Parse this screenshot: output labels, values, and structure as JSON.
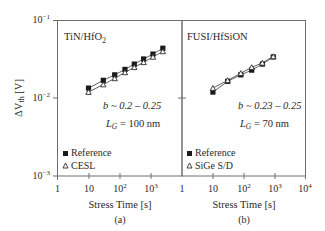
{
  "figure": {
    "ylabel": "ΔV_th [V]",
    "xlabel": "Stress Time [s]",
    "y_ticks": [
      {
        "base": "10",
        "exp": "−1",
        "value": 0.1
      },
      {
        "base": "10",
        "exp": "−2",
        "value": 0.01
      },
      {
        "base": "10",
        "exp": "−3",
        "value": 0.001
      }
    ],
    "x_ticks_a": [
      {
        "base": "1",
        "exp": "",
        "value": 1
      },
      {
        "base": "10",
        "exp": "",
        "value": 10
      },
      {
        "base": "10",
        "exp": "2",
        "value": 100
      },
      {
        "base": "10",
        "exp": "3",
        "value": 1000
      }
    ],
    "x_ticks_b": [
      {
        "base": "1",
        "exp": "",
        "value": 1
      },
      {
        "base": "10",
        "exp": "",
        "value": 10
      },
      {
        "base": "10",
        "exp": "2",
        "value": 100
      },
      {
        "base": "10",
        "exp": "3",
        "value": 1000
      },
      {
        "base": "10",
        "exp": "4",
        "value": 10000
      }
    ]
  },
  "chart_data": [
    {
      "type": "scatter",
      "panel_label": "(a)",
      "title": "TiN/HfO2",
      "title_main": "TiN/HfO",
      "title_sub": "2",
      "annotation_b": "b ~ 0.2 – 0.25",
      "annotation_lg": "L_G = 100 nm",
      "annotation_lg_value": "= 100 nm",
      "xlabel": "Stress Time [s]",
      "ylabel": "ΔVth [V]",
      "xscale": "log",
      "yscale": "log",
      "xlim": [
        1,
        10000
      ],
      "ylim": [
        0.001,
        0.1
      ],
      "legend": [
        "Reference",
        "CESL"
      ],
      "legend_position": "lower left",
      "series": [
        {
          "name": "Reference",
          "marker": "filled-square",
          "x": [
            10,
            30,
            70,
            150,
            300,
            600,
            1200,
            2500
          ],
          "y": [
            0.0135,
            0.017,
            0.02,
            0.0235,
            0.0275,
            0.032,
            0.037,
            0.044
          ]
        },
        {
          "name": "CESL",
          "marker": "open-triangle",
          "x": [
            10,
            30,
            70,
            150,
            300,
            600,
            1200,
            2500
          ],
          "y": [
            0.012,
            0.015,
            0.018,
            0.0215,
            0.025,
            0.029,
            0.034,
            0.04
          ]
        }
      ]
    },
    {
      "type": "scatter",
      "panel_label": "(b)",
      "title": "FUSI/HfSiON",
      "annotation_b": "b ~ 0.23 – 0.25",
      "annotation_lg": "L_G = 70 nm",
      "annotation_lg_value": "= 70 nm",
      "xlabel": "Stress Time [s]",
      "ylabel": "ΔVth [V]",
      "xscale": "log",
      "yscale": "log",
      "xlim": [
        1,
        10000
      ],
      "ylim": [
        0.001,
        0.1
      ],
      "legend": [
        "Reference",
        "SiGe S/D"
      ],
      "legend_position": "lower left",
      "series": [
        {
          "name": "Reference",
          "marker": "filled-square",
          "x": [
            10,
            30,
            80,
            180,
            400,
            900
          ],
          "y": [
            0.012,
            0.0165,
            0.02,
            0.023,
            0.0275,
            0.034
          ]
        },
        {
          "name": "SiGe S/D",
          "marker": "open-triangle",
          "x": [
            10,
            30,
            80,
            180,
            400,
            900
          ],
          "y": [
            0.0135,
            0.017,
            0.021,
            0.025,
            0.0285,
            0.0345
          ]
        }
      ]
    }
  ]
}
